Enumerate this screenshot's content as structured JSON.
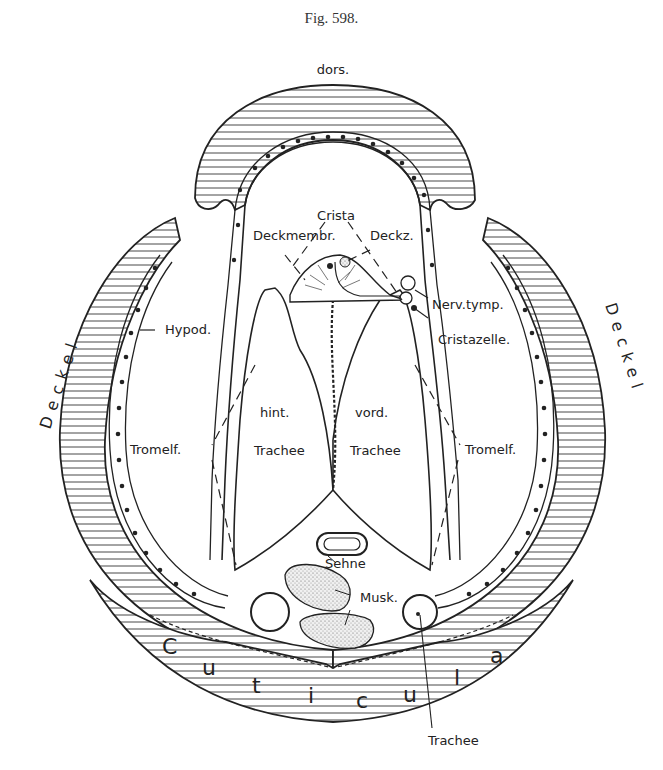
{
  "figure": {
    "title": "Fig. 598.",
    "orientation_label": "dors."
  },
  "labels": {
    "crista": "Crista",
    "deckmembr": "Deckmembr.",
    "deckz": "Deckz.",
    "nerv_tymp": "Nerv.tymp.",
    "cristazelle": "Cristazelle.",
    "hypod": "Hypod.",
    "deckel_left": "Deckel",
    "deckel_right": "Deckel",
    "hint": "hint.",
    "vord": "vord.",
    "trachee_hint": "Trachee",
    "trachee_vord": "Trachee",
    "tromelf_left": "Tromelf.",
    "tromelf_right": "Tromelf.",
    "sehne": "Sehne",
    "musk": "Musk.",
    "cuticula_letters": [
      "C",
      "u",
      "t",
      "i",
      "c",
      "u",
      "l",
      "a"
    ],
    "trachee_bottom": "Trachee"
  },
  "colors": {
    "ink": "#222222",
    "paper": "#ffffff",
    "stipple": "#e6e6e6"
  }
}
